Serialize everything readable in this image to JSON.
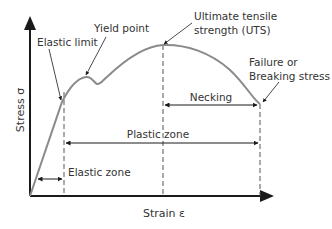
{
  "diagram": {
    "type": "stress-strain curve",
    "axes": {
      "x_label": "Strain ε",
      "y_label": "Stress σ"
    },
    "annotations": {
      "elastic_limit": "Elastic limit",
      "yield_point": "Yield point",
      "uts_line1": "Ultimate tensile",
      "uts_line2": "strength (UTS)",
      "failure_line1": "Failure or",
      "failure_line2": "Breaking stress"
    },
    "zones": {
      "necking": "Necking",
      "plastic": "Plastic zone",
      "elastic": "Elastic zone"
    },
    "colors": {
      "curve": "#8a8a8a",
      "axis": "#1a1a1a",
      "text": "#333333",
      "dashed": "#555555"
    }
  }
}
